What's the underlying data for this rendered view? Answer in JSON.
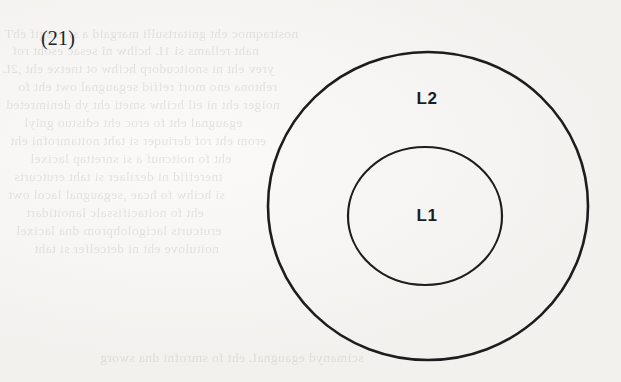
{
  "page": {
    "width": 621,
    "height": 382,
    "background_color": "#f8f7f5",
    "ink_color": "#1d1d1d",
    "media": "scanned-book-page"
  },
  "figure": {
    "number_label": "(21)",
    "caption": "",
    "type": "concentric-circles-venn"
  },
  "diagram": {
    "stroke_color": "#1d1d1d",
    "fill_color": "none",
    "shapes": [
      {
        "name": "outer-circle",
        "label": "L2",
        "cx": 428,
        "cy": 206,
        "rx": 160,
        "ry": 154,
        "stroke_width": 2.6
      },
      {
        "name": "inner-circle",
        "label": "L1",
        "cx": 425,
        "cy": 216,
        "rx": 77,
        "ry": 69,
        "stroke_width": 2.2
      }
    ],
    "labels": {
      "outer": "L2",
      "inner": "L1"
    }
  },
  "ghost_text": {
    "description": "faint mirrored show-through text from the reverse side of the page",
    "color": "#b9b6b1",
    "lines": [
      {
        "top": 26,
        "left": 4,
        "text": "nosiraqmoc eht gnitartsulli margaid a si erugif ehT"
      },
      {
        "top": 43,
        "left": 12,
        "text": "naht rellams si 1L hcihw ni sesac esoht rof"
      },
      {
        "top": 61,
        "left": 2,
        "text": "yrev eht ni snoitcudorp hcihw ot tnetxe eht ,2L"
      },
      {
        "top": 79,
        "left": 18,
        "text": "rehtona eno morf reffid segaugnal owt eht fo"
      },
      {
        "top": 97,
        "left": 6,
        "text": "noiger eht ni eil hcihw smeti eht yb denimreted"
      },
      {
        "top": 115,
        "left": 24,
        "text": "egaugnal eht fo eroc eht edistuo gniyl"
      },
      {
        "top": 133,
        "left": 10,
        "text": "erom eht rof deriuqer si taht noitamrofni eht"
      },
      {
        "top": 151,
        "left": 30,
        "text": "eht fo noitcnuf a si snrettap lacixel"
      },
      {
        "top": 169,
        "left": 14,
        "text": "tnereffid ni dezilaer si taht erutcurts"
      },
      {
        "top": 187,
        "left": 8,
        "text": "si hcihw fo hcae ,segaugnal lacol owt"
      },
      {
        "top": 205,
        "left": 26,
        "text": "eht fo noitacifissalc lanoitidart"
      },
      {
        "top": 223,
        "left": 16,
        "text": "erutcurts lacigolohprom dna lacixel"
      },
      {
        "top": 241,
        "left": 34,
        "text": "noitulove eht ni detcelfer si taht"
      },
      {
        "top": 350,
        "left": 100,
        "text": "scimanyd egaugnaL eht fo smrofni dna sworg"
      }
    ]
  }
}
